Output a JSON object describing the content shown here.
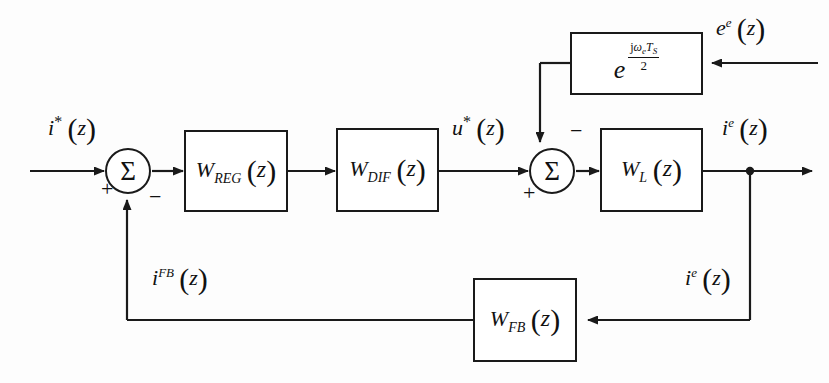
{
  "diagram": {
    "type": "control-system-block-diagram",
    "colors": {
      "line": "#1a1a1a",
      "background": "#ffffff",
      "text": "#111111"
    },
    "blocks": [
      {
        "id": "w_reg",
        "label": "W_REG (z)",
        "symbol": "W",
        "subscript": "REG",
        "argument": "z",
        "x": 184,
        "y": 130,
        "w": 104,
        "h": 82
      },
      {
        "id": "w_dif",
        "label": "W_DIF (z)",
        "symbol": "W",
        "subscript": "DIF",
        "argument": "z",
        "x": 336,
        "y": 128,
        "w": 103,
        "h": 84
      },
      {
        "id": "w_l",
        "label": "W_L (z)",
        "symbol": "W",
        "subscript": "L",
        "argument": "z",
        "x": 600,
        "y": 128,
        "w": 103,
        "h": 84
      },
      {
        "id": "w_fb",
        "label": "W_FB (z)",
        "symbol": "W",
        "subscript": "FB",
        "argument": "z",
        "x": 473,
        "y": 278,
        "w": 104,
        "h": 84
      },
      {
        "id": "delay_exp",
        "label": "e^(j omega_e T_S / 2)",
        "base": "e",
        "exponent_numerator": "jω_e T_S",
        "exponent_denominator": "2",
        "x": 570,
        "y": 32,
        "w": 133,
        "h": 63
      }
    ],
    "summers": [
      {
        "id": "summer-1",
        "symbol": "Σ",
        "cx": 128,
        "cy": 171,
        "r": 23,
        "signs": [
          {
            "text": "+",
            "position": "input-left",
            "x": 101,
            "y": 182
          },
          {
            "text": "−",
            "position": "input-bottom",
            "x": 149,
            "y": 190
          }
        ]
      },
      {
        "id": "summer-2",
        "symbol": "Σ",
        "cx": 552,
        "cy": 171,
        "r": 23,
        "signs": [
          {
            "text": "−",
            "position": "input-top",
            "x": 571,
            "y": 125
          },
          {
            "text": "+",
            "position": "input-left",
            "x": 523,
            "y": 184
          }
        ]
      }
    ],
    "signals": [
      {
        "id": "reference-current",
        "base": "i",
        "superscript": "*",
        "argument": "z",
        "text": "i*(z)",
        "x": 48,
        "y": 118
      },
      {
        "id": "control-voltage",
        "base": "u",
        "superscript": "*",
        "argument": "z",
        "text": "u*(z)",
        "x": 455,
        "y": 118
      },
      {
        "id": "output-current-top",
        "base": "i",
        "superscript": "e",
        "argument": "z",
        "text": "i^e(z)",
        "x": 726,
        "y": 118
      },
      {
        "id": "back-emf",
        "base": "e",
        "superscript": "e",
        "argument": "z",
        "text": "e^e(z)",
        "x": 718,
        "y": 18
      },
      {
        "id": "feedback-current",
        "base": "i",
        "superscript": "FB",
        "argument": "z",
        "text": "i^FB(z)",
        "x": 155,
        "y": 268
      },
      {
        "id": "output-current-branch",
        "base": "i",
        "superscript": "e",
        "argument": "z",
        "text": "i^e(z)",
        "x": 688,
        "y": 268
      }
    ]
  }
}
